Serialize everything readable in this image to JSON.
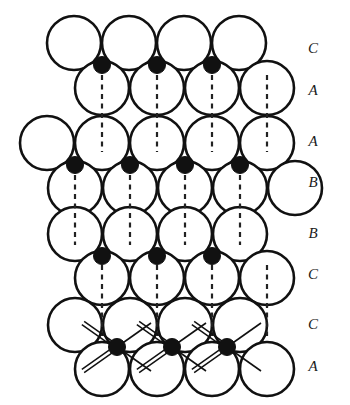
{
  "figure": {
    "title": "",
    "colors": {
      "sphere_outline": "#111111",
      "sphere_fill": "#ffffff",
      "interstitial_atom": "#111111",
      "dashed_axis": "#222222",
      "bond_line": "#111111",
      "background": "#ffffff",
      "label_text": "#1a1a1a"
    },
    "geometry": {
      "sphere_radius": 27,
      "sphere_stroke_width": 2.6,
      "dot_radius": 8.5,
      "row_spacing": 41,
      "column_spacing": 55
    },
    "layer_labels": [
      {
        "text": "C",
        "x": 313,
        "y": 50
      },
      {
        "text": "A",
        "x": 313,
        "y": 92
      },
      {
        "text": "A",
        "x": 313,
        "y": 143
      },
      {
        "text": "B",
        "x": 313,
        "y": 184
      },
      {
        "text": "B",
        "x": 313,
        "y": 235
      },
      {
        "text": "C",
        "x": 313,
        "y": 276
      },
      {
        "text": "C",
        "x": 313,
        "y": 326
      },
      {
        "text": "A",
        "x": 313,
        "y": 368
      }
    ],
    "rows": [
      {
        "label": "C",
        "cy": 43,
        "cx": [
          74,
          129,
          184,
          239
        ]
      },
      {
        "label": "A",
        "cy": 88,
        "cx": [
          102,
          157,
          212,
          267
        ]
      },
      {
        "label": "A",
        "cy": 143,
        "cx": [
          47,
          102,
          157,
          212,
          267
        ]
      },
      {
        "label": "B",
        "cy": 188,
        "cx": [
          75,
          130,
          185,
          240,
          295
        ]
      },
      {
        "label": "B",
        "cy": 234,
        "cx": [
          75,
          130,
          185,
          240
        ]
      },
      {
        "label": "C",
        "cy": 278,
        "cx": [
          102,
          157,
          212,
          267
        ]
      },
      {
        "label": "C",
        "cy": 325,
        "cx": [
          75,
          130,
          185,
          240
        ]
      },
      {
        "label": "A",
        "cy": 369,
        "cx": [
          102,
          157,
          212,
          267
        ]
      }
    ],
    "interstitial_dots": [
      {
        "cx": 102,
        "cy": 65
      },
      {
        "cx": 157,
        "cy": 65
      },
      {
        "cx": 212,
        "cy": 65
      },
      {
        "cx": 75,
        "cy": 165
      },
      {
        "cx": 130,
        "cy": 165
      },
      {
        "cx": 185,
        "cy": 165
      },
      {
        "cx": 240,
        "cy": 165
      },
      {
        "cx": 102,
        "cy": 256
      },
      {
        "cx": 157,
        "cy": 256
      },
      {
        "cx": 212,
        "cy": 256
      },
      {
        "cx": 117,
        "cy": 347
      },
      {
        "cx": 172,
        "cy": 347
      },
      {
        "cx": 227,
        "cy": 347
      }
    ],
    "dashed_axes": [
      {
        "x": 102,
        "y1": 75,
        "y2": 152
      },
      {
        "x": 157,
        "y1": 75,
        "y2": 152
      },
      {
        "x": 212,
        "y1": 75,
        "y2": 152
      },
      {
        "x": 267,
        "y1": 75,
        "y2": 152
      },
      {
        "x": 75,
        "y1": 175,
        "y2": 245
      },
      {
        "x": 130,
        "y1": 175,
        "y2": 245
      },
      {
        "x": 185,
        "y1": 175,
        "y2": 245
      },
      {
        "x": 240,
        "y1": 175,
        "y2": 245
      },
      {
        "x": 102,
        "y1": 265,
        "y2": 336
      },
      {
        "x": 157,
        "y1": 265,
        "y2": 336
      },
      {
        "x": 212,
        "y1": 265,
        "y2": 336
      },
      {
        "x": 267,
        "y1": 265,
        "y2": 336
      }
    ],
    "tetra_bonds": [
      {
        "cx": 117,
        "cy": 347,
        "double": [
          [
            -34,
            -24
          ],
          [
            -34,
            24
          ]
        ],
        "single": [
          [
            34,
            -24
          ],
          [
            34,
            24
          ]
        ]
      },
      {
        "cx": 172,
        "cy": 347,
        "double": [
          [
            -34,
            -24
          ],
          [
            -34,
            24
          ]
        ],
        "single": [
          [
            34,
            -24
          ],
          [
            34,
            24
          ]
        ]
      },
      {
        "cx": 227,
        "cy": 347,
        "double": [
          [
            -34,
            -24
          ],
          [
            -34,
            24
          ]
        ],
        "single": [
          [
            34,
            -24
          ],
          [
            34,
            24
          ]
        ]
      }
    ]
  }
}
